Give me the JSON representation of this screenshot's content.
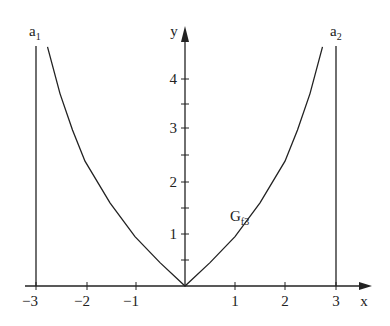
{
  "chart_data": {
    "type": "line",
    "title": "",
    "xlabel": "x",
    "ylabel": "y",
    "xlim": [
      -3.0,
      3.4
    ],
    "ylim": [
      0,
      4.8
    ],
    "x_ticks": [
      "-3",
      "-2",
      "-1",
      "1",
      "2",
      "3"
    ],
    "y_ticks": [
      "1",
      "2",
      "3",
      "4"
    ],
    "grid": false,
    "series": [
      {
        "name": "G_f3",
        "label_main": "G",
        "label_sub": "f3",
        "x": [
          -2.75,
          -2.5,
          -2.25,
          -2.0,
          -1.5,
          -1.0,
          -0.5,
          0,
          0.5,
          1.0,
          1.5,
          2.0,
          2.25,
          2.5,
          2.75
        ],
        "y": [
          4.6,
          3.7,
          3.0,
          2.4,
          1.6,
          0.95,
          0.45,
          0,
          0.45,
          0.95,
          1.6,
          2.4,
          3.0,
          3.7,
          4.6
        ]
      }
    ],
    "asymptotes": [
      {
        "name": "a1",
        "label_main": "a",
        "label_sub": "1",
        "x": -3
      },
      {
        "name": "a2",
        "label_main": "a",
        "label_sub": "2",
        "x": 3
      }
    ]
  },
  "labels": {
    "x_axis": "x",
    "y_axis": "y",
    "ticks_x": [
      "−3",
      "−2",
      "−1",
      "1",
      "2",
      "3"
    ],
    "ticks_y": [
      "1",
      "2",
      "3",
      "4"
    ],
    "curve_main": "G",
    "curve_sub": "f3",
    "a1_main": "a",
    "a1_sub": "1",
    "a2_main": "a",
    "a2_sub": "2"
  }
}
